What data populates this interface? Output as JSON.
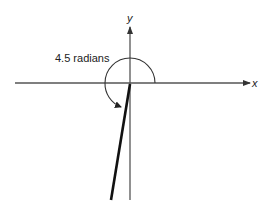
{
  "diagram": {
    "angle_label": "4.5 radians",
    "x_axis_label": "x",
    "y_axis_label": "y",
    "angle_radians": 4.5,
    "colors": {
      "axis": "#555555",
      "arc": "#333333",
      "terminal_ray": "#111111",
      "text": "#222222",
      "background": "#ffffff"
    }
  }
}
